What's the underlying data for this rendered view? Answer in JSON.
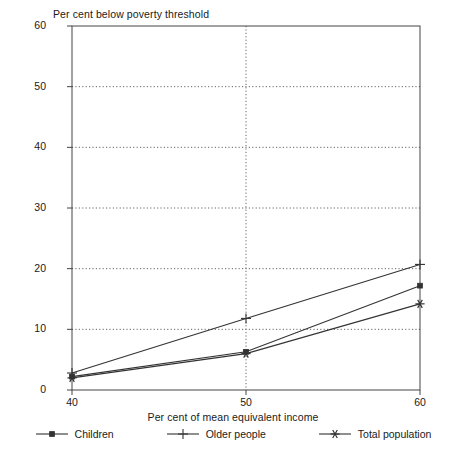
{
  "chart_data": {
    "type": "line",
    "title": "",
    "ylabel": "Per cent below poverty threshold",
    "xlabel": "Per cent of mean equivalent income",
    "x": [
      40,
      50,
      60
    ],
    "xlim": [
      40,
      60
    ],
    "ylim": [
      0,
      60
    ],
    "xticks": [
      40,
      50,
      60
    ],
    "yticks": [
      0,
      10,
      20,
      30,
      40,
      50,
      60
    ],
    "grid": "horizontal-dotted",
    "legend_position": "bottom",
    "series": [
      {
        "name": "Children",
        "marker": "square",
        "color": "#333333",
        "values": [
          2.2,
          6.3,
          17.2
        ]
      },
      {
        "name": "Older people",
        "marker": "plus",
        "color": "#333333",
        "values": [
          2.8,
          11.8,
          20.7
        ]
      },
      {
        "name": "Total population",
        "marker": "star",
        "color": "#333333",
        "values": [
          2.0,
          6.0,
          14.2
        ]
      }
    ]
  },
  "axes": {
    "y_title": "Per cent below poverty threshold",
    "x_title": "Per cent of mean equivalent income",
    "y_tick_labels": [
      "60",
      "50",
      "40",
      "30",
      "20",
      "10",
      "0"
    ],
    "x_tick_labels": [
      "40",
      "50",
      "60"
    ]
  },
  "legend": {
    "entries": [
      {
        "label": "Children",
        "marker": "square-marker-icon"
      },
      {
        "label": "Older people",
        "marker": "plus-marker-icon"
      },
      {
        "label": "Total population",
        "marker": "star-marker-icon"
      }
    ]
  },
  "caption": {
    "text": ""
  }
}
